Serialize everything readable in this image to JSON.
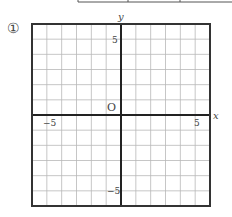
{
  "problem": {
    "number_marker": "①"
  },
  "top_table": {
    "visible": "partial-bottom-edge",
    "dividers_x": [
      78,
      128,
      180
    ]
  },
  "graph": {
    "grid": {
      "cols": 12,
      "rows": 12,
      "x_min": -6,
      "x_max": 6,
      "y_min": -6,
      "y_max": 6,
      "step": 1
    },
    "axis_labels": {
      "x": "x",
      "y": "y"
    },
    "origin_label": "O",
    "tick_labels": {
      "x_pos": "5",
      "x_neg": "−5",
      "y_pos": "5",
      "y_neg": "−5"
    },
    "colors": {
      "grid": "#b8b8b8",
      "axis": "#222222",
      "border": "#333333"
    }
  }
}
